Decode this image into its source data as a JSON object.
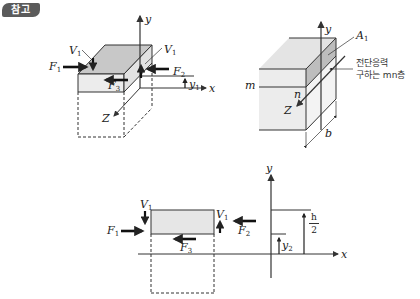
{
  "header": {
    "badge_label": "참고"
  },
  "diagram_left": {
    "labels": {
      "F1": "F",
      "F1_sub": "1",
      "F2": "F",
      "F2_sub": "2",
      "F3": "F",
      "F3_sub": "3",
      "V1_left": "V",
      "V1_left_sub": "1",
      "V1_right": "V",
      "V1_right_sub": "1",
      "y_axis": "y",
      "x_axis": "x",
      "z_axis": "Z",
      "y1": "y",
      "y1_sub": "1"
    }
  },
  "diagram_right": {
    "labels": {
      "y_axis": "y",
      "z_axis": "Z",
      "A1": "A",
      "A1_sub": "1",
      "m": "m",
      "n": "n",
      "b": "b",
      "annotation_line1": "전단응력",
      "annotation_line2": "구하는 mn층"
    }
  },
  "diagram_bottom": {
    "labels": {
      "F1": "F",
      "F1_sub": "1",
      "F2": "F",
      "F2_sub": "2",
      "F3": "F",
      "F3_sub": "3",
      "V1_left": "V",
      "V1_left_sub": "1",
      "V1_right": "V",
      "V1_right_sub": "1",
      "y_axis": "y",
      "x_axis": "x",
      "y2": "y",
      "y2_sub": "2",
      "h_num": "h",
      "h_den": "2"
    }
  },
  "colors": {
    "top_face": "#c8c8c8",
    "front_face": "#ececec",
    "shaded_region": "#bdbdbd",
    "stroke": "#333333",
    "badge": "#5b5b5b"
  }
}
